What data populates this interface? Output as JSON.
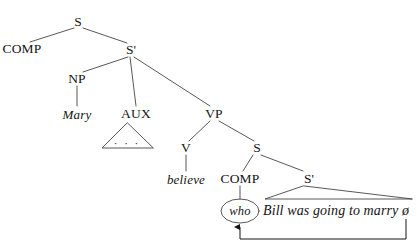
{
  "diagram": {
    "type": "syntax-tree",
    "ink_color": "#141414",
    "background_color": "#ffffff",
    "nodes": [
      {
        "id": "s-top",
        "label": "S",
        "x": 78,
        "y": 22,
        "style": "cat"
      },
      {
        "id": "comp-top",
        "label": "COMP",
        "x": 22,
        "y": 49,
        "style": "cat"
      },
      {
        "id": "sbar-upper",
        "label": "S'",
        "x": 131,
        "y": 50,
        "style": "cat"
      },
      {
        "id": "np",
        "label": "NP",
        "x": 77,
        "y": 79,
        "style": "cat"
      },
      {
        "id": "mary",
        "label": "Mary",
        "x": 77,
        "y": 114,
        "style": "terminal"
      },
      {
        "id": "aux",
        "label": "AUX",
        "x": 136,
        "y": 114,
        "style": "cat"
      },
      {
        "id": "vp",
        "label": "VP",
        "x": 214,
        "y": 114,
        "style": "cat"
      },
      {
        "id": "v",
        "label": "V",
        "x": 186,
        "y": 148,
        "style": "cat"
      },
      {
        "id": "believe",
        "label": "believe",
        "x": 186,
        "y": 179,
        "style": "terminal"
      },
      {
        "id": "s-lower",
        "label": "S",
        "x": 257,
        "y": 148,
        "style": "cat"
      },
      {
        "id": "comp-lower",
        "label": "COMP",
        "x": 240,
        "y": 179,
        "style": "cat"
      },
      {
        "id": "sbar-lower",
        "label": "S'",
        "x": 309,
        "y": 179,
        "style": "cat"
      },
      {
        "id": "who",
        "label": "who",
        "x": 240,
        "y": 211,
        "style": "moved"
      },
      {
        "id": "embedded",
        "label": "Bill was going to marry ø",
        "x": 336,
        "y": 211,
        "style": "sentence"
      }
    ],
    "edges": [
      {
        "from": "s-top",
        "to": "comp-top"
      },
      {
        "from": "s-top",
        "to": "sbar-upper"
      },
      {
        "from": "sbar-upper",
        "to": "np"
      },
      {
        "from": "sbar-upper",
        "to": "aux"
      },
      {
        "from": "sbar-upper",
        "to": "vp"
      },
      {
        "from": "np",
        "to": "mary"
      },
      {
        "from": "vp",
        "to": "v"
      },
      {
        "from": "vp",
        "to": "s-lower"
      },
      {
        "from": "v",
        "to": "believe"
      },
      {
        "from": "s-lower",
        "to": "comp-lower"
      },
      {
        "from": "s-lower",
        "to": "sbar-lower"
      },
      {
        "from": "comp-lower",
        "to": "who"
      }
    ],
    "triangles": [
      {
        "id": "aux-triangle",
        "under": "aux",
        "apex_x": 127,
        "apex_y": 123,
        "left_x": 102,
        "right_x": 153,
        "base_y": 148,
        "contents": "· · ·"
      },
      {
        "id": "embedded-triangle",
        "under": "sbar-lower",
        "apex_x": 303,
        "apex_y": 186,
        "left_x": 265,
        "right_x": 412,
        "base_y": 199,
        "contents": ""
      }
    ],
    "movement": {
      "id": "wh-movement-arrow",
      "from_label": "ø",
      "to_label": "who",
      "path": "M 406 219 L 406 239 L 240 239 L 240 226",
      "arrowhead": "up"
    },
    "ellipse": {
      "id": "who-ellipse",
      "cx": 240,
      "cy": 211,
      "rx": 19,
      "ry": 12
    }
  }
}
